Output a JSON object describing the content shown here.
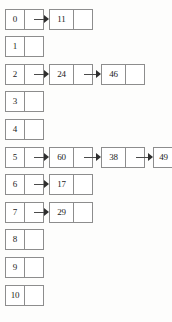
{
  "diagram": {
    "type": "hash-table-chaining",
    "bucket_count": 11,
    "colors": {
      "border": "#8d8d8d",
      "text": "#1c1c1c",
      "arrow": "#2e2e2e",
      "background": "#fdfdfc"
    },
    "buckets": [
      {
        "index": "0",
        "chain": [
          "11"
        ]
      },
      {
        "index": "1",
        "chain": []
      },
      {
        "index": "2",
        "chain": [
          "24",
          "46"
        ]
      },
      {
        "index": "3",
        "chain": []
      },
      {
        "index": "4",
        "chain": []
      },
      {
        "index": "5",
        "chain": [
          "60",
          "38",
          "49"
        ]
      },
      {
        "index": "6",
        "chain": [
          "17"
        ]
      },
      {
        "index": "7",
        "chain": [
          "29"
        ]
      },
      {
        "index": "8",
        "chain": []
      },
      {
        "index": "9",
        "chain": []
      },
      {
        "index": "10",
        "chain": []
      }
    ]
  }
}
